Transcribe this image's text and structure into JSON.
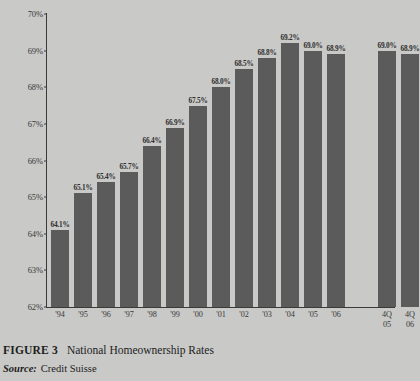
{
  "figure": {
    "number_label": "FIGURE 3",
    "title": "National Homeownership Rates",
    "source_label": "Source:",
    "source_value": "Credit Suisse"
  },
  "colors": {
    "background": "#c9c9c7",
    "bar": "#5b5b5b",
    "axis": "#3a3a38",
    "text": "#1d1d1d"
  },
  "chart_data": {
    "type": "bar",
    "title": "National Homeownership Rates",
    "xlabel": "",
    "ylabel": "",
    "ylim": [
      62,
      70
    ],
    "ytick_labels": [
      "70%",
      "69%",
      "68%",
      "67%",
      "66%",
      "65%",
      "64%",
      "63%",
      "62%"
    ],
    "yticks": [
      70,
      69,
      68,
      67,
      66,
      65,
      64,
      63,
      62
    ],
    "grid": false,
    "legend": null,
    "categories": [
      "'94",
      "'95",
      "'96",
      "'97",
      "'98",
      "'99",
      "'00",
      "'01",
      "'02",
      "'03",
      "'04",
      "'05",
      "'06",
      "4Q\n05",
      "4Q\n06"
    ],
    "values": [
      64.1,
      65.1,
      65.4,
      65.7,
      66.4,
      66.9,
      67.5,
      68.0,
      68.5,
      68.8,
      69.2,
      69.0,
      68.9,
      69.0,
      68.9
    ],
    "data_labels": [
      "64.1%",
      "65.1%",
      "65.4%",
      "65.7%",
      "66.4%",
      "66.9%",
      "67.5%",
      "68.0%",
      "68.5%",
      "68.8%",
      "69.2%",
      "69.0%",
      "68.9%",
      "69.0%",
      "68.9%"
    ],
    "group_break_after_index": 12,
    "annotations": []
  }
}
